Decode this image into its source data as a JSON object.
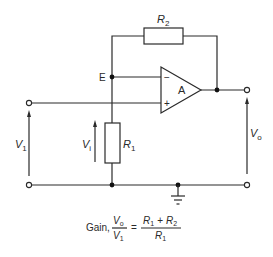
{
  "diagram": {
    "type": "non-inverting op-amp amplifier circuit",
    "components": {
      "R2": {
        "name": "R",
        "sub": "2"
      },
      "R1": {
        "name": "R",
        "sub": "1"
      },
      "opamp": {
        "label": "A",
        "minus": "−",
        "plus": "+"
      }
    },
    "nodes": {
      "E": "E"
    },
    "voltages": {
      "V1": {
        "name": "V",
        "sub": "1"
      },
      "Vi": {
        "name": "V",
        "sub": "i"
      },
      "Vo": {
        "name": "V",
        "sub": "o"
      }
    },
    "formula": {
      "prefix": "Gain,",
      "lhs_num": {
        "name": "V",
        "sub": "o"
      },
      "lhs_den": {
        "name": "V",
        "sub": "1"
      },
      "equals": "=",
      "rhs_num_a": {
        "name": "R",
        "sub": "1"
      },
      "rhs_plus": "+",
      "rhs_num_b": {
        "name": "R",
        "sub": "2"
      },
      "rhs_den": {
        "name": "R",
        "sub": "1"
      }
    },
    "colors": {
      "line": "#2a2a2a",
      "background": "#ffffff"
    }
  }
}
